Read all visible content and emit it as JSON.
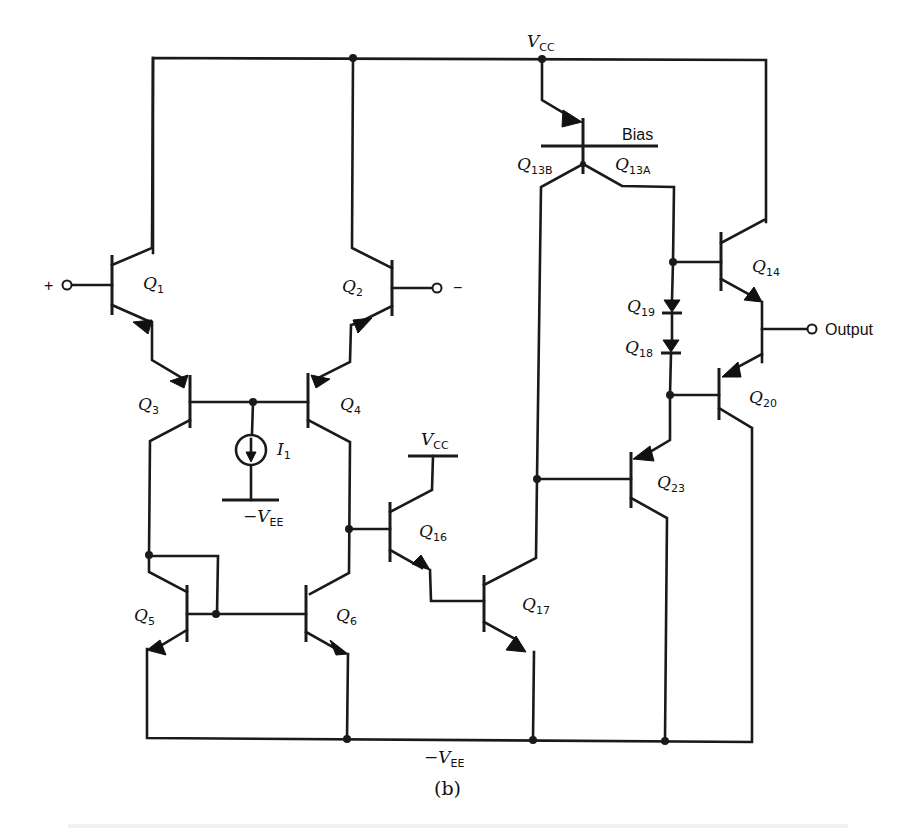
{
  "figure": {
    "subfigure_label": "(b)",
    "caption_partial": "Figure (cut off at bottom edge)"
  },
  "supplies": {
    "vcc_top": {
      "main": "V",
      "sub": "CC"
    },
    "vcc_q16": {
      "main": "V",
      "sub": "CC"
    },
    "vee_source": {
      "main": "−V",
      "sub": "EE"
    },
    "vee_bottom": {
      "main": "−V",
      "sub": "EE"
    }
  },
  "terminals": {
    "noninverting": "+",
    "inverting": "−",
    "output": "Output"
  },
  "bias_label": "Bias",
  "current_source": {
    "main": "I",
    "sub": "1"
  },
  "transistors": [
    {
      "id": "Q1",
      "main": "Q",
      "sub": "1"
    },
    {
      "id": "Q2",
      "main": "Q",
      "sub": "2"
    },
    {
      "id": "Q3",
      "main": "Q",
      "sub": "3"
    },
    {
      "id": "Q4",
      "main": "Q",
      "sub": "4"
    },
    {
      "id": "Q5",
      "main": "Q",
      "sub": "5"
    },
    {
      "id": "Q6",
      "main": "Q",
      "sub": "6"
    },
    {
      "id": "Q16",
      "main": "Q",
      "sub": "16"
    },
    {
      "id": "Q17",
      "main": "Q",
      "sub": "17"
    },
    {
      "id": "Q13B",
      "main": "Q",
      "sub": "13B"
    },
    {
      "id": "Q13A",
      "main": "Q",
      "sub": "13A"
    },
    {
      "id": "Q14",
      "main": "Q",
      "sub": "14"
    },
    {
      "id": "Q19",
      "main": "Q",
      "sub": "19"
    },
    {
      "id": "Q18",
      "main": "Q",
      "sub": "18"
    },
    {
      "id": "Q20",
      "main": "Q",
      "sub": "20"
    },
    {
      "id": "Q23",
      "main": "Q",
      "sub": "23"
    }
  ],
  "colors": {
    "ink": "#1a1a1a",
    "paper": "#ffffff"
  }
}
